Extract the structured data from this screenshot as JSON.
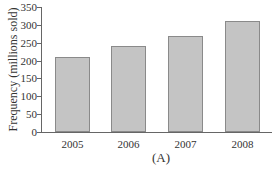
{
  "chart_data": {
    "type": "bar",
    "title": "",
    "caption": "(A)",
    "xlabel": "",
    "ylabel": "Frequency (millions sold)",
    "categories": [
      "2005",
      "2006",
      "2007",
      "2008"
    ],
    "values": [
      210,
      240,
      270,
      310
    ],
    "ylim": [
      0,
      350
    ],
    "yticks": [
      "0",
      "50",
      "100",
      "150",
      "200",
      "250",
      "300",
      "350"
    ],
    "grid": false,
    "bar_color": "#c4c4c4"
  }
}
